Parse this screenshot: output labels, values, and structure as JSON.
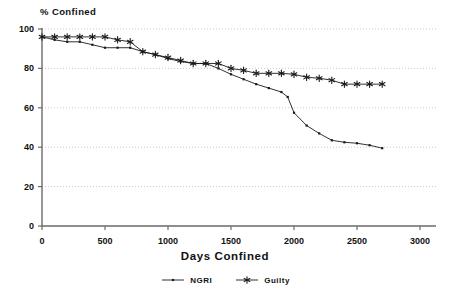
{
  "chart_data": {
    "type": "line",
    "title": "",
    "ylabel": "% Confined",
    "xlabel": "Days Confined",
    "xlim": [
      0,
      3000
    ],
    "ylim": [
      0,
      100
    ],
    "xticks": [
      0,
      500,
      1000,
      1500,
      2000,
      2500,
      3000
    ],
    "yticks": [
      0,
      20,
      40,
      60,
      80,
      100
    ],
    "grid": true,
    "grid_axis": "y",
    "legend_position": "bottom-center",
    "series": [
      {
        "name": "NGRI",
        "marker": "small-dot",
        "color": "#1a1a1a",
        "points": [
          [
            0,
            96
          ],
          [
            100,
            94.5
          ],
          [
            200,
            93.5
          ],
          [
            300,
            93.5
          ],
          [
            400,
            92
          ],
          [
            500,
            90.5
          ],
          [
            600,
            90.5
          ],
          [
            700,
            90.5
          ],
          [
            800,
            88.5
          ],
          [
            900,
            87
          ],
          [
            1000,
            85
          ],
          [
            1100,
            83.5
          ],
          [
            1200,
            82.5
          ],
          [
            1300,
            82.5
          ],
          [
            1400,
            80
          ],
          [
            1500,
            77
          ],
          [
            1600,
            74.5
          ],
          [
            1700,
            72
          ],
          [
            1800,
            70
          ],
          [
            1900,
            68
          ],
          [
            1950,
            65.5
          ],
          [
            2000,
            57.5
          ],
          [
            2100,
            51
          ],
          [
            2200,
            47
          ],
          [
            2300,
            43.5
          ],
          [
            2400,
            42.5
          ],
          [
            2500,
            42
          ],
          [
            2600,
            41
          ],
          [
            2700,
            39.5
          ]
        ]
      },
      {
        "name": "Guilty",
        "marker": "asterisk",
        "color": "#1a1a1a",
        "points": [
          [
            0,
            96
          ],
          [
            100,
            96
          ],
          [
            200,
            96
          ],
          [
            300,
            96
          ],
          [
            400,
            96
          ],
          [
            500,
            96
          ],
          [
            600,
            94.5
          ],
          [
            700,
            93.5
          ],
          [
            800,
            88.5
          ],
          [
            900,
            87
          ],
          [
            1000,
            85.5
          ],
          [
            1100,
            84
          ],
          [
            1200,
            82.5
          ],
          [
            1300,
            82.5
          ],
          [
            1400,
            82.5
          ],
          [
            1500,
            80
          ],
          [
            1600,
            79
          ],
          [
            1700,
            77.5
          ],
          [
            1800,
            77.5
          ],
          [
            1900,
            77.5
          ],
          [
            2000,
            77
          ],
          [
            2100,
            75.5
          ],
          [
            2200,
            75
          ],
          [
            2300,
            74
          ],
          [
            2400,
            72
          ],
          [
            2500,
            72
          ],
          [
            2600,
            72
          ],
          [
            2700,
            72
          ]
        ]
      }
    ]
  },
  "legend": {
    "items": [
      {
        "label": "NGRI"
      },
      {
        "label": "Guilty"
      }
    ]
  }
}
